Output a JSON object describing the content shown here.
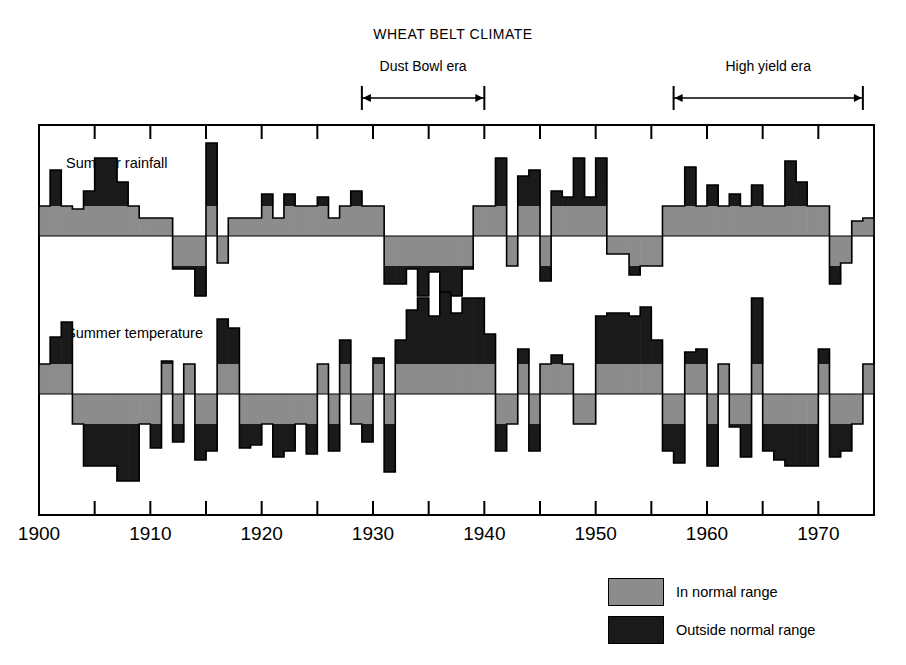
{
  "title": "WHEAT BELT CLIMATE",
  "eras": [
    {
      "name": "dust-bowl",
      "label": "Dust Bowl era",
      "start": 1929,
      "end": 1940
    },
    {
      "name": "high-yield",
      "label": "High yield era",
      "start": 1957,
      "end": 1974
    }
  ],
  "axis": {
    "xmin": 1900,
    "xmax": 1974,
    "tick_step": 5,
    "labels": [
      "1900",
      "1910",
      "1920",
      "1930",
      "1940",
      "1950",
      "1960",
      "1970"
    ],
    "label_years": [
      1900,
      1910,
      1920,
      1930,
      1940,
      1950,
      1960,
      1970
    ]
  },
  "legend": {
    "items": [
      {
        "label": "In normal range",
        "color": "#8c8c8c"
      },
      {
        "label": "Outside normal range",
        "color": "#1a1a1a"
      }
    ]
  },
  "colors": {
    "normal": "#8c8c8c",
    "outside": "#1a1a1a",
    "frame": "#000000",
    "background": "#ffffff"
  },
  "chart_data": {
    "type": "area",
    "title": "WHEAT BELT CLIMATE",
    "xlabel": "",
    "ylabel": "",
    "grid": false,
    "legend_position": "bottom-right",
    "note": "Each year is a step column. Value is anomaly from normal; the part within the normal band is gray, the excess beyond the band is black.",
    "x": [
      1900,
      1901,
      1902,
      1903,
      1904,
      1905,
      1906,
      1907,
      1908,
      1909,
      1910,
      1911,
      1912,
      1913,
      1914,
      1915,
      1916,
      1917,
      1918,
      1919,
      1920,
      1921,
      1922,
      1923,
      1924,
      1925,
      1926,
      1927,
      1928,
      1929,
      1930,
      1931,
      1932,
      1933,
      1934,
      1935,
      1936,
      1937,
      1938,
      1939,
      1940,
      1941,
      1942,
      1943,
      1944,
      1945,
      1946,
      1947,
      1948,
      1949,
      1950,
      1951,
      1952,
      1953,
      1954,
      1955,
      1956,
      1957,
      1958,
      1959,
      1960,
      1961,
      1962,
      1963,
      1964,
      1965,
      1966,
      1967,
      1968,
      1969,
      1970,
      1971,
      1972,
      1973,
      1974
    ],
    "normal_band": {
      "rainfall": 1.0,
      "temperature": 1.0
    },
    "series": [
      {
        "name": "Summer rainfall",
        "label": "Summer rainfall",
        "values": [
          1.0,
          2.2,
          1.0,
          0.9,
          1.5,
          2.6,
          2.6,
          1.8,
          1.0,
          0.6,
          0.6,
          0.6,
          -1.1,
          -1.1,
          -2.0,
          3.1,
          -0.9,
          0.6,
          0.6,
          0.6,
          1.4,
          0.6,
          1.4,
          1.0,
          1.0,
          1.3,
          0.6,
          1.0,
          1.5,
          1.0,
          1.0,
          -1.6,
          -1.6,
          -1.1,
          -2.0,
          -1.2,
          -2.0,
          -2.0,
          -1.1,
          1.0,
          1.0,
          2.6,
          -1.0,
          2.0,
          2.2,
          -1.5,
          1.5,
          1.3,
          2.6,
          1.3,
          2.6,
          -0.6,
          -0.6,
          -1.3,
          -1.0,
          -1.0,
          1.0,
          1.0,
          2.3,
          1.0,
          1.7,
          1.0,
          1.4,
          1.0,
          1.7,
          1.0,
          1.0,
          2.5,
          1.8,
          1.0,
          1.0,
          -1.6,
          -0.9,
          0.5,
          0.6
        ]
      },
      {
        "name": "Summer temperature",
        "label": "Summer temperature",
        "values": [
          1.0,
          1.9,
          2.4,
          -1.0,
          -2.4,
          -2.4,
          -2.4,
          -2.9,
          -2.9,
          -1.0,
          -1.8,
          1.1,
          -1.6,
          1.0,
          -2.2,
          -1.9,
          2.5,
          2.2,
          -1.8,
          -1.7,
          -1.0,
          -2.1,
          -1.9,
          -1.0,
          -2.0,
          1.0,
          -1.9,
          1.8,
          -1.0,
          -1.6,
          1.2,
          -2.6,
          1.8,
          2.8,
          3.2,
          2.6,
          3.4,
          2.7,
          3.2,
          3.2,
          2.0,
          -1.9,
          -1.0,
          1.5,
          -1.9,
          1.0,
          1.3,
          1.0,
          -1.0,
          -1.0,
          2.6,
          2.7,
          2.7,
          2.6,
          2.9,
          1.8,
          -1.9,
          -2.3,
          1.4,
          1.5,
          -2.4,
          1.0,
          -1.1,
          -2.1,
          3.2,
          -1.9,
          -2.2,
          -2.4,
          -2.4,
          -2.4,
          1.5,
          -2.1,
          -1.9,
          -1.0,
          1.0
        ]
      }
    ]
  }
}
